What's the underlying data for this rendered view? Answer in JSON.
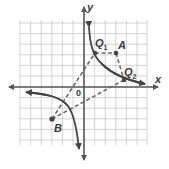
{
  "diagram": {
    "type": "coordinate-plane",
    "curve": "hyperbola y = k/x (two branches, quadrants I and III)",
    "axes": {
      "x_label": "x",
      "y_label": "y",
      "origin_label": "0"
    },
    "points": [
      {
        "name": "Q",
        "subscript": "1",
        "px": [
          95,
          53
        ]
      },
      {
        "name": "A",
        "subscript": "",
        "px": [
          116,
          53
        ]
      },
      {
        "name": "Q",
        "subscript": "2",
        "px": [
          124,
          80
        ]
      },
      {
        "name": "B",
        "subscript": "",
        "px": [
          52,
          119
        ]
      }
    ],
    "dashed_segments": [
      [
        "Q1",
        "A"
      ],
      [
        "A",
        "Q2"
      ],
      [
        "B",
        "Q1"
      ],
      [
        "B",
        "Q2"
      ]
    ],
    "colors": {
      "grid": "#c8c8c8",
      "axis": "#555555",
      "curve": "#444444",
      "dash": "#666666",
      "point": "#444444"
    }
  },
  "labels": {
    "y": "y",
    "x": "x",
    "origin": "0",
    "q1": "Q",
    "q1_sub": "1",
    "a": "A",
    "q2": "Q",
    "q2_sub": "2",
    "b": "B"
  }
}
